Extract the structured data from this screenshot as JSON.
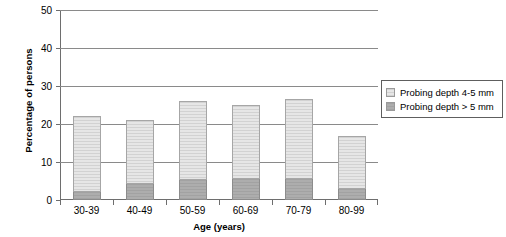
{
  "chart_data": {
    "type": "bar",
    "subtype": "stacked-vertical",
    "title": "",
    "xlabel": "Age (years)",
    "ylabel": "Percentage of persons",
    "categories": [
      "30-39",
      "40-49",
      "50-59",
      "60-69",
      "70-79",
      "80-99"
    ],
    "ylim": [
      0,
      50
    ],
    "yticks": [
      0,
      10,
      20,
      30,
      40,
      50
    ],
    "ytick_labels": [
      "0",
      "10",
      "20",
      "30",
      "40",
      "50"
    ],
    "grid": "horizontal",
    "legend_position": "right",
    "series": [
      {
        "name": "Probing depth > 5 mm",
        "color": "#a8a8a8",
        "values": [
          2.1,
          4.1,
          5.2,
          5.4,
          5.4,
          2.9
        ]
      },
      {
        "name": "Probing depth 4-5 mm",
        "color": "#dedede",
        "values": [
          20.0,
          16.9,
          20.9,
          19.6,
          21.2,
          13.9
        ]
      }
    ],
    "totals": [
      22.1,
      21.0,
      26.1,
      25.0,
      26.6,
      16.8
    ],
    "stack_order": [
      "Probing depth > 5 mm",
      "Probing depth 4-5 mm"
    ]
  },
  "legend": {
    "items": [
      {
        "label": "Probing depth 4-5 mm",
        "swatch": "light-gray-hatch"
      },
      {
        "label": "Probing depth > 5 mm",
        "swatch": "dark-gray-hatch"
      }
    ]
  },
  "axes": {
    "y_title": "Percentage of persons",
    "x_title": "Age (years)"
  }
}
